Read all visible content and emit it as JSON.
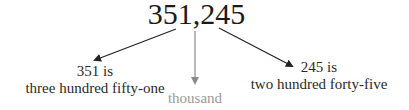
{
  "number": "351,245",
  "left": {
    "line1": "351 is",
    "line2": "three hundred fifty-one"
  },
  "center": {
    "label": "thousand"
  },
  "right": {
    "line1": "245 is",
    "line2": "two hundred forty-five"
  },
  "colors": {
    "text": "#1a1a1a",
    "arrow": "#222222",
    "center_arrow": "#8a8a8a",
    "center_text": "#9a9a9a"
  }
}
